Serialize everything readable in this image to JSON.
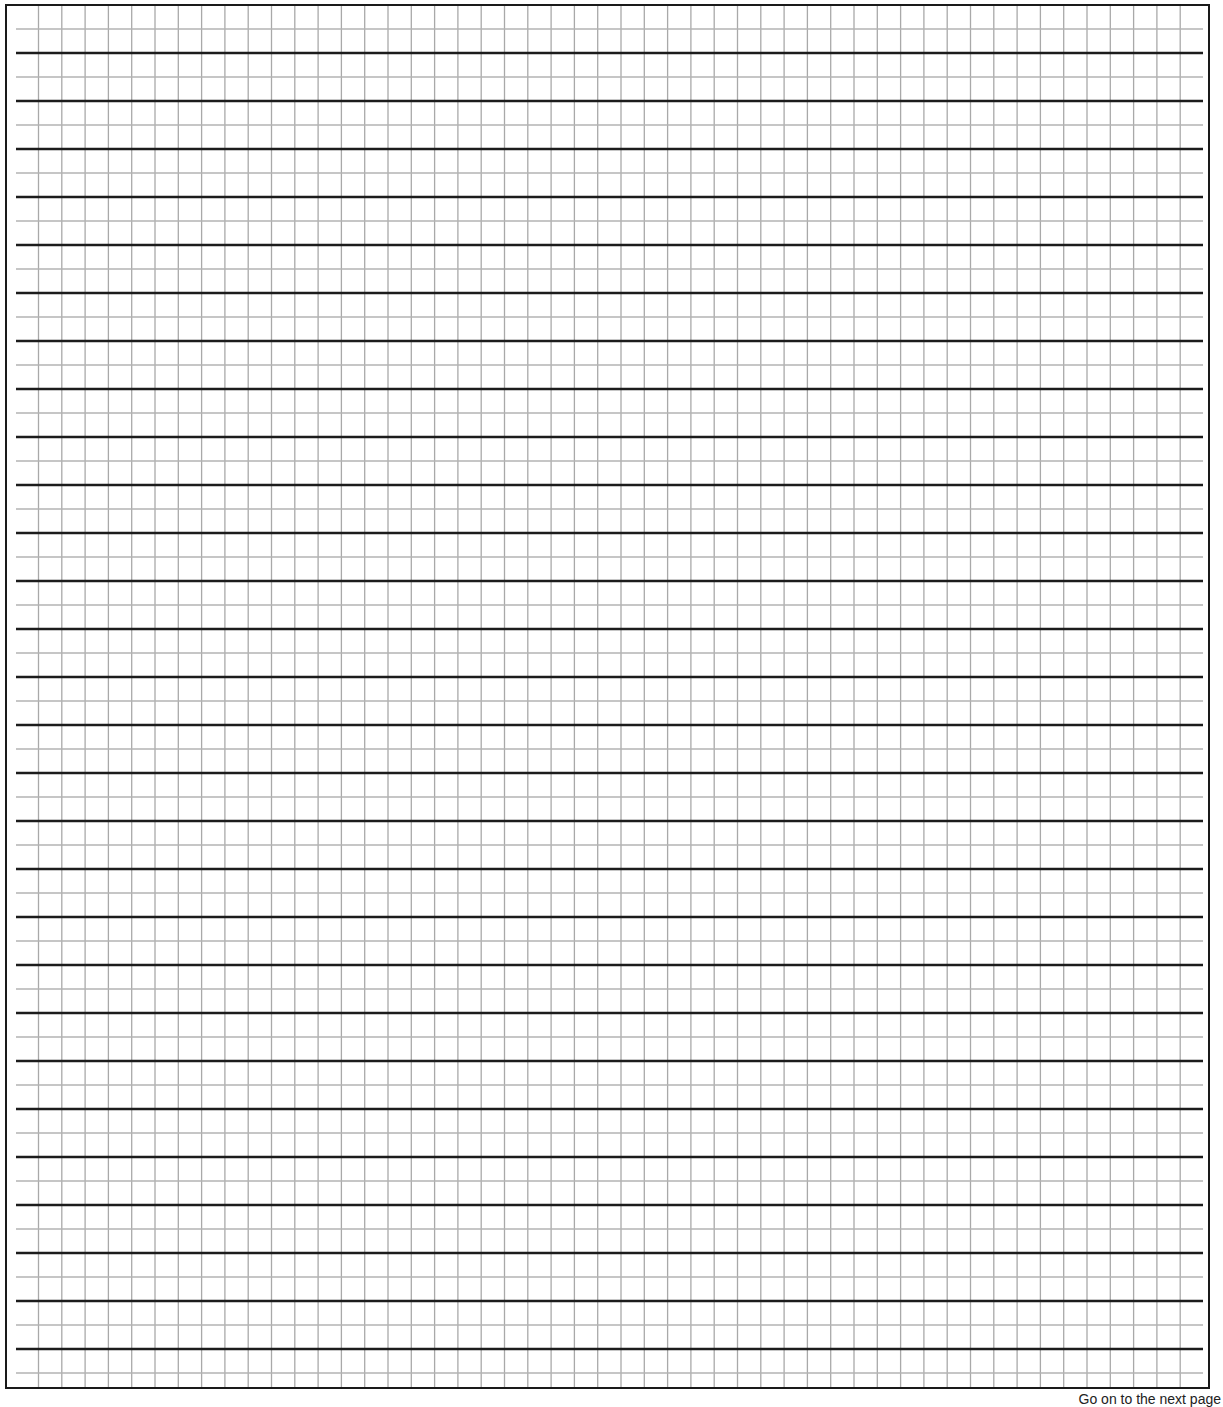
{
  "page": {
    "type": "ruled answer sheet with grid",
    "footer": {
      "text": "Go on to the next page"
    }
  },
  "grid": {
    "vertical": {
      "start_x": 38.5,
      "spacing": 23.3,
      "count": 50,
      "top": 6,
      "bottom": 1388,
      "color": "#a9a9a9"
    },
    "ruled_dark": {
      "start_y": 53,
      "spacing": 48,
      "count": 28,
      "x1": 16,
      "x2": 1203,
      "color": "#1c1c1c",
      "width": 2.6
    },
    "ruled_light": {
      "start_y": 29,
      "spacing": 48,
      "count": 29,
      "x1": 16,
      "x2": 1203,
      "color": "#b3b3b3",
      "width": 1.3
    }
  },
  "colors": {
    "border": "#1a1a1a",
    "background": "#ffffff"
  }
}
